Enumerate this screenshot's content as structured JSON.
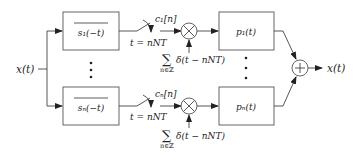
{
  "input": {
    "label": "x(t)"
  },
  "output": {
    "label": "x(t)"
  },
  "branches": [
    {
      "filter_label": "s₁(−t)",
      "sample_label": "t = nNT",
      "coef_label": "c₁[n]",
      "impulse_sum": "∑",
      "impulse_sub": "n∈ℤ",
      "impulse_label": "δ(t − nNT)",
      "synth_label": "p₁(t)"
    },
    {
      "filter_label": "sₙ(−t)",
      "sample_label": "t = nNT",
      "coef_label": "cₙ[n]",
      "impulse_sum": "∑",
      "impulse_sub": "n∈ℤ",
      "impulse_label": "δ(t − nNT)",
      "synth_label": "pₙ(t)"
    }
  ],
  "symbols": {
    "multiplier": "multiply-icon",
    "summer": "plus-icon",
    "ellipsis": "vertical-dots"
  }
}
